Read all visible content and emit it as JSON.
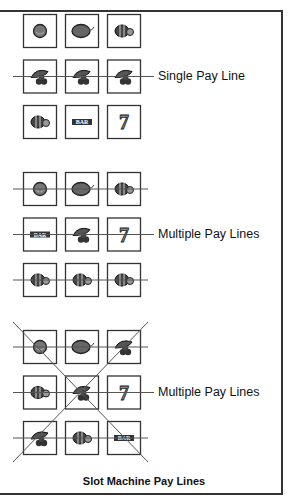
{
  "caption": "Slot Machine Pay Lines",
  "groups": [
    {
      "label": "Single Pay Line",
      "symbols": [
        [
          "plum",
          "lemon",
          "watermelon"
        ],
        [
          "cherries",
          "cherries",
          "cherries"
        ],
        [
          "watermelon",
          "bar",
          "seven"
        ]
      ],
      "lines": [
        "middle-row"
      ]
    },
    {
      "label": "Multiple Pay Lines",
      "symbols": [
        [
          "plum",
          "lemon",
          "watermelon"
        ],
        [
          "bar",
          "cherries",
          "seven"
        ],
        [
          "watermelon",
          "watermelon",
          "watermelon"
        ]
      ],
      "lines": [
        "top-row",
        "middle-row",
        "bottom-row"
      ]
    },
    {
      "label": "Multiple Pay Lines",
      "symbols": [
        [
          "plum",
          "lemon",
          "cherries"
        ],
        [
          "watermelon",
          "cherries",
          "seven"
        ],
        [
          "cherries",
          "watermelon",
          "bar"
        ]
      ],
      "lines": [
        "top-row",
        "middle-row",
        "bottom-row",
        "diagonal-down",
        "diagonal-up"
      ]
    }
  ],
  "symbol_text": {
    "bar": "BAR",
    "seven": "7"
  },
  "colors": {
    "line": "#555555",
    "box": "#333333",
    "fruit": "#555555"
  }
}
